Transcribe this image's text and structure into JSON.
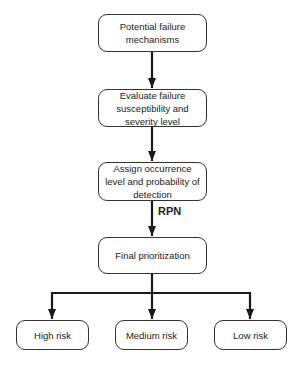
{
  "diagram": {
    "type": "flowchart",
    "nodes": {
      "n1": "Potential failure mechanisms",
      "n2": "Evaluate failure susceptibility and severity level",
      "n3": "Assign occurrence level and probability of detection",
      "n4": "Final prioritization",
      "high": "High risk",
      "medium": "Medium risk",
      "low": "Low risk"
    },
    "edge_labels": {
      "rpn": "RPN"
    },
    "edges": [
      [
        "n1",
        "n2"
      ],
      [
        "n2",
        "n3"
      ],
      [
        "n3",
        "n4",
        "RPN"
      ],
      [
        "n4",
        "high"
      ],
      [
        "n4",
        "medium"
      ],
      [
        "n4",
        "low"
      ]
    ],
    "colors": {
      "stroke": "#1a1a1a",
      "fill": "#ffffff"
    }
  }
}
